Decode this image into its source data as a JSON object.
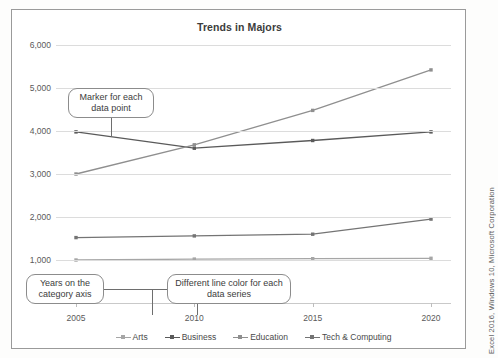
{
  "credit": "Excel 2016, Windows 10, Microsoft Corporation",
  "chart_data": {
    "type": "line",
    "title": "Trends in Majors",
    "xlabel": "",
    "ylabel": "",
    "categories": [
      "2005",
      "2010",
      "2015",
      "2020"
    ],
    "ylim": [
      0,
      6000
    ],
    "yticks": [
      "1,000",
      "2,000",
      "3,000",
      "4,000",
      "5,000",
      "6,000"
    ],
    "ytick_values": [
      1000,
      2000,
      3000,
      4000,
      5000,
      6000
    ],
    "grid": true,
    "legend_position": "bottom",
    "series": [
      {
        "name": "Arts",
        "values": [
          1000,
          1020,
          1030,
          1040
        ],
        "color": "#a6a6a6"
      },
      {
        "name": "Business",
        "values": [
          3980,
          3600,
          3780,
          3980
        ],
        "color": "#5a5a5a"
      },
      {
        "name": "Education",
        "values": [
          3000,
          3680,
          4480,
          5420
        ],
        "color": "#8f8f8f"
      },
      {
        "name": "Tech & Computing",
        "values": [
          1520,
          1560,
          1600,
          1950
        ],
        "color": "#747474"
      }
    ]
  },
  "callouts": [
    {
      "id": "marker",
      "text": "Marker for each data point"
    },
    {
      "id": "years",
      "text": "Years on the category axis"
    },
    {
      "id": "colors",
      "text": "Different line color for each data series"
    }
  ]
}
